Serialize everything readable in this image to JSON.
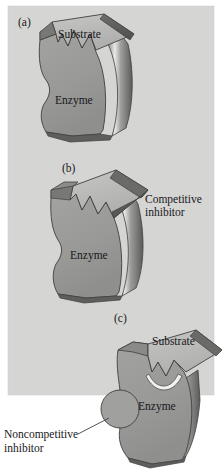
{
  "figure": {
    "background_color": "#ffffff",
    "panel_background_color": "#d5d5d3",
    "enzyme_face_color": "#9a9a98",
    "enzyme_side_color": "#6d6d6b",
    "substrate_top_color": "#b9b9b7",
    "highlight_color": "#ececeb",
    "outline_color": "#3a3a3c",
    "text_color": "#17171a",
    "panels": [
      {
        "id": "a",
        "label": "(a)",
        "labels": {
          "substrate": "Substrate",
          "enzyme": "Enzyme"
        }
      },
      {
        "id": "b",
        "label": "(b)",
        "labels": {
          "inhibitor_line1": "Competitive",
          "inhibitor_line2": "inhibitor",
          "enzyme": "Enzyme"
        }
      },
      {
        "id": "c",
        "label": "(c)",
        "labels": {
          "substrate": "Substrate",
          "enzyme": "Enzyme",
          "inhibitor_line1": "Noncompetitive",
          "inhibitor_line2": "inhibitor"
        }
      }
    ]
  }
}
